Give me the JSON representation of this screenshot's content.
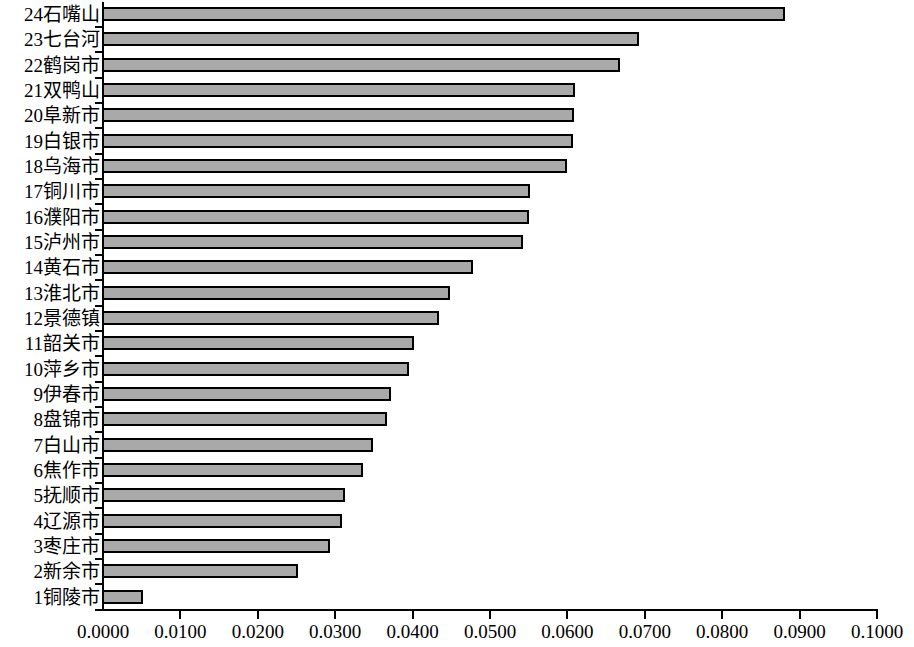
{
  "chart_data": {
    "type": "bar",
    "orientation": "horizontal",
    "title": "",
    "subtitle": "",
    "xlabel": "",
    "ylabel": "",
    "xlim": [
      0.0,
      0.1
    ],
    "xtick_labels": [
      "0.0000",
      "0.0100",
      "0.0200",
      "0.0300",
      "0.0400",
      "0.0500",
      "0.0600",
      "0.0700",
      "0.0800",
      "0.0900",
      "0.1000"
    ],
    "xtick_values": [
      0.0,
      0.01,
      0.02,
      0.03,
      0.04,
      0.05,
      0.06,
      0.07,
      0.08,
      0.09,
      0.1
    ],
    "grid": false,
    "legend": false,
    "bar_fill_color": "#a9a9a9",
    "bar_edge_color": "#000000",
    "categories": [
      "24石嘴山",
      "23七台河",
      "22鹤岗市",
      "21双鸭山",
      "20阜新市",
      "19白银市",
      "18乌海市",
      "17铜川市",
      "16濮阳市",
      "15泸州市",
      "14黄石市",
      "13淮北市",
      "12景德镇",
      "11韶关市",
      "10萍乡市",
      "9伊春市",
      "8盘锦市",
      "7白山市",
      "6焦作市",
      "5抚顺市",
      "4辽源市",
      "3枣庄市",
      "2新余市",
      "1铜陵市"
    ],
    "values": [
      0.0881,
      0.0692,
      0.0668,
      0.061,
      0.0609,
      0.0607,
      0.0599,
      0.0552,
      0.055,
      0.0542,
      0.0478,
      0.0448,
      0.0434,
      0.0402,
      0.0395,
      0.0372,
      0.0367,
      0.0349,
      0.0336,
      0.0313,
      0.0309,
      0.0293,
      0.0252,
      0.0052
    ]
  }
}
